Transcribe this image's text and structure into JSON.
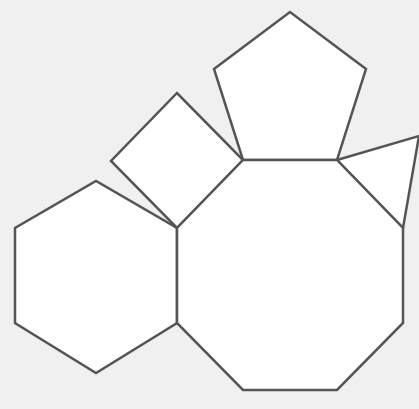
{
  "diagram": {
    "background_color": "#f0f0f0",
    "fill_color": "#ffffff",
    "stroke_color": "#555555",
    "shapes": [
      {
        "name": "octagon",
        "sides": 8
      },
      {
        "name": "pentagon",
        "sides": 5
      },
      {
        "name": "square",
        "sides": 4
      },
      {
        "name": "triangle",
        "sides": 3
      },
      {
        "name": "hexagon",
        "sides": 6
      }
    ]
  }
}
